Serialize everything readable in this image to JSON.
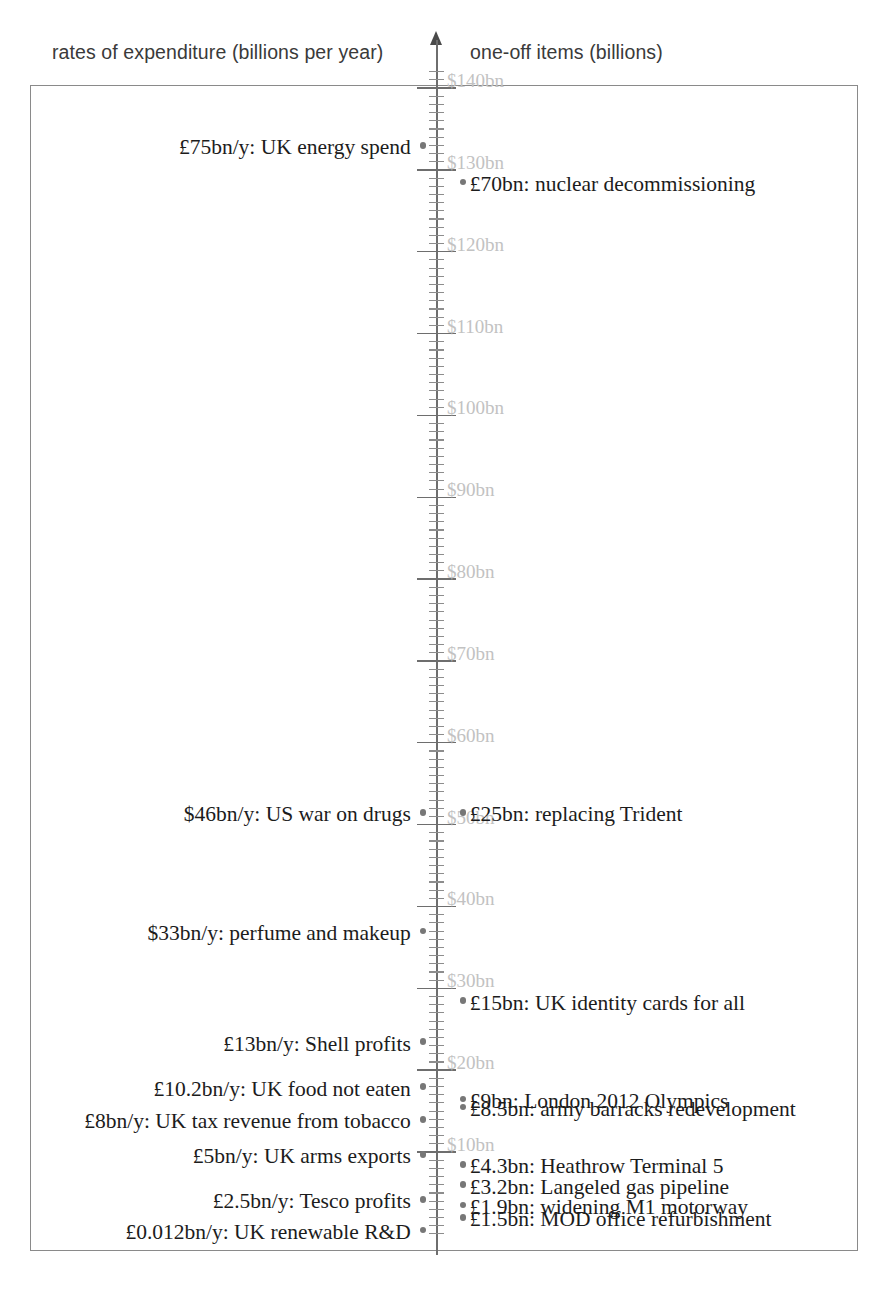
{
  "headers": {
    "left": "rates of expenditure (billions per year)",
    "right": "one-off items (billions)"
  },
  "chart_data": {
    "type": "scatter",
    "title": "",
    "subtitle": "",
    "xlabel": "",
    "ylabel": "",
    "orientation": "vertical-axis-dual-column",
    "grid": false,
    "legend_position": "none",
    "axis": {
      "unit": "bn",
      "currency_symbol": "$",
      "tick_major_step": 10,
      "tick_minor_step": 1,
      "range": [
        0,
        140
      ],
      "tick_labels": [
        "$140bn",
        "$130bn",
        "$120bn",
        "$110bn",
        "$100bn",
        "$90bn",
        "$80bn",
        "$70bn",
        "$60bn",
        "$50bn",
        "$40bn",
        "$30bn",
        "$20bn",
        "$10bn"
      ],
      "tick_values": [
        140,
        130,
        120,
        110,
        100,
        90,
        80,
        70,
        60,
        50,
        40,
        30,
        20,
        10
      ]
    },
    "series": [
      {
        "name": "rates of expenditure (billions per year)",
        "side": "left",
        "items": [
          {
            "label": "£75bn/y: UK energy spend",
            "value": 75,
            "axis_position": 133.0
          },
          {
            "label": "$46bn/y: US war on drugs",
            "value": 46,
            "axis_position": 51.5
          },
          {
            "label": "$33bn/y: perfume and makeup",
            "value": 33,
            "axis_position": 37.0
          },
          {
            "label": "£13bn/y: Shell profits",
            "value": 13,
            "axis_position": 23.5
          },
          {
            "label": "£10.2bn/y: UK food not eaten",
            "value": 10.2,
            "axis_position": 18.0
          },
          {
            "label": "£8bn/y: UK tax revenue from tobacco",
            "value": 8,
            "axis_position": 14.0
          },
          {
            "label": "£5bn/y: UK arms exports",
            "value": 5,
            "axis_position": 9.7
          },
          {
            "label": "£2.5bn/y: Tesco profits",
            "value": 2.5,
            "axis_position": 4.2
          },
          {
            "label": "£0.012bn/y: UK renewable R&D",
            "value": 0.012,
            "axis_position": 0.5
          }
        ]
      },
      {
        "name": "one-off items (billions)",
        "side": "right",
        "items": [
          {
            "label": "£70bn: nuclear decommissioning",
            "value": 70,
            "axis_position": 128.5
          },
          {
            "label": "£25bn: replacing Trident",
            "value": 25,
            "axis_position": 51.5
          },
          {
            "label": "£15bn: UK identity cards for all",
            "value": 15,
            "axis_position": 28.5
          },
          {
            "label": "£9bn: London 2012 Olympics",
            "value": 9,
            "axis_position": 16.5
          },
          {
            "label": "£8.5bn: army barracks redevelopment",
            "value": 8.5,
            "axis_position": 15.5
          },
          {
            "label": "£4.3bn: Heathrow Terminal 5",
            "value": 4.3,
            "axis_position": 8.5
          },
          {
            "label": "£3.2bn: Langeled gas pipeline",
            "value": 3.2,
            "axis_position": 6.0
          },
          {
            "label": "£1.9bn: widening M1 motorway",
            "value": 1.9,
            "axis_position": 3.5
          },
          {
            "label": "£1.5bn: MOD office refurbishment",
            "value": 1.5,
            "axis_position": 2.0
          }
        ]
      }
    ]
  },
  "colors": {
    "text": "#1c1c1c",
    "header_text": "#3a3a3a",
    "axis": "#6e6e6e",
    "axis_label": "#c2c2c2",
    "marker": "#777777",
    "box_border": "#8a8a8a"
  }
}
